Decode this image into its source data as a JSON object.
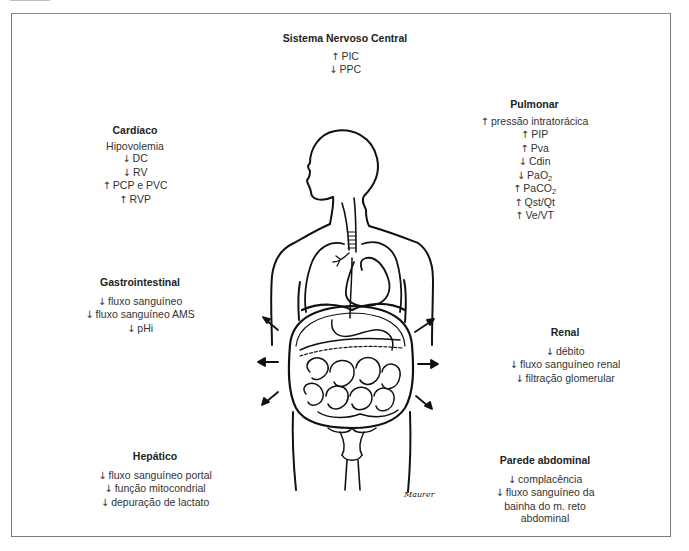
{
  "figure": {
    "signature": "Maurer"
  },
  "panels": {
    "cns": {
      "title": "Sistema Nervoso Central",
      "items": [
        {
          "dir": "up",
          "text": "PIC"
        },
        {
          "dir": "down",
          "text": "PPC"
        }
      ]
    },
    "cardiac": {
      "title": "Cardíaco",
      "items": [
        {
          "dir": "",
          "text": "Hipovolemia"
        },
        {
          "dir": "down",
          "text": "DC"
        },
        {
          "dir": "down",
          "text": "RV"
        },
        {
          "dir": "up",
          "text": "PCP e PVC"
        },
        {
          "dir": "up",
          "text": "RVP"
        }
      ]
    },
    "pulmonary": {
      "title": "Pulmonar",
      "items": [
        {
          "dir": "up",
          "text": "pressão intratorácica"
        },
        {
          "dir": "up",
          "text": "PIP"
        },
        {
          "dir": "up",
          "text": "Pva"
        },
        {
          "dir": "down",
          "text": "Cdin"
        },
        {
          "dir": "down",
          "text": "PaO",
          "sub": "2"
        },
        {
          "dir": "up",
          "text": "PaCO",
          "sub": "2"
        },
        {
          "dir": "up",
          "text": "Qst/Qt"
        },
        {
          "dir": "up",
          "text": "Ve/VT"
        }
      ]
    },
    "gastrointestinal": {
      "title": "Gastrointestinal",
      "items": [
        {
          "dir": "down",
          "text": "fluxo sanguíneo"
        },
        {
          "dir": "down",
          "text": "fluxo sanguíneo AMS"
        },
        {
          "dir": "down",
          "text": "pHi"
        }
      ]
    },
    "renal": {
      "title": "Renal",
      "items": [
        {
          "dir": "down",
          "text": "débito"
        },
        {
          "dir": "down",
          "text": "fluxo sanguíneo renal"
        },
        {
          "dir": "down",
          "text": "filtração glomerular"
        }
      ]
    },
    "hepatic": {
      "title": "Hepático",
      "items": [
        {
          "dir": "down",
          "text": "fluxo sanguíneo portal"
        },
        {
          "dir": "down",
          "text": "função mitocondrial"
        },
        {
          "dir": "down",
          "text": "depuração de lactato"
        }
      ]
    },
    "abdominal_wall": {
      "title": "Parede abdominal",
      "items": [
        {
          "dir": "down",
          "text": "complacência"
        },
        {
          "dir": "down",
          "text": "fluxo sanguíneo da bainha do m. reto abdominal"
        }
      ]
    }
  },
  "glyphs": {
    "up": "↑",
    "down": "↓"
  }
}
